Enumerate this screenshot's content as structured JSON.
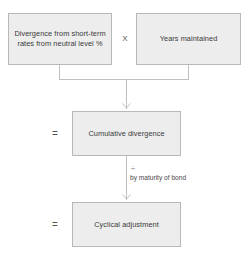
{
  "diagram": {
    "type": "flowchart",
    "nodes": [
      {
        "id": "divergence",
        "label": "Divergence from short-term rates from neutral level %"
      },
      {
        "id": "years",
        "label": "Years maintained"
      },
      {
        "id": "cumulative",
        "label": "Cumulative divergence"
      },
      {
        "id": "cyclical",
        "label": "Cyclical adjustment"
      }
    ],
    "operators": {
      "multiply": "X",
      "equals_middle": "=",
      "equals_bottom": "=",
      "divide": "÷"
    },
    "annotations": {
      "maturity": "by maturity of bond"
    },
    "colors": {
      "node_fill": "#ededed",
      "node_border": "#b8b8b8",
      "connector": "#c0c0c0",
      "text": "#3a3a3a",
      "background": "#ffffff"
    }
  }
}
